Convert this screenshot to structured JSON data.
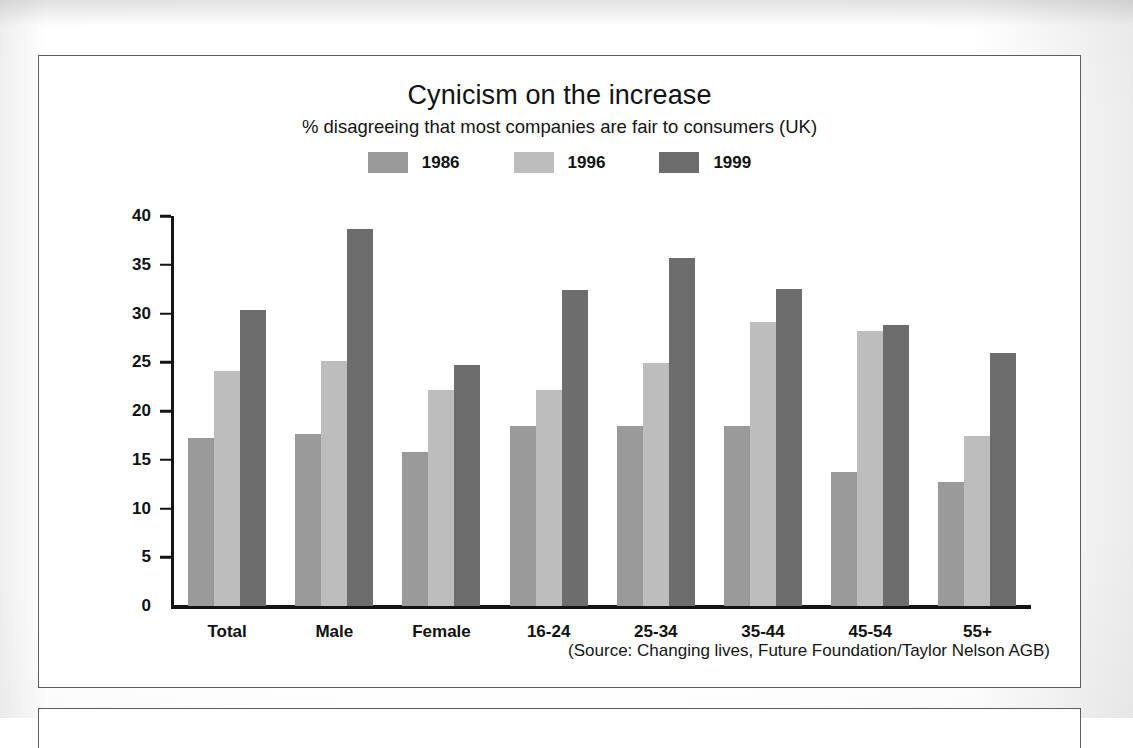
{
  "figure": {
    "title": "Cynicism on the increase",
    "subtitle": "% disagreeing that most companies are fair to consumers (UK)",
    "source": "(Source: Changing lives, Future Foundation/Taylor Nelson AGB)"
  },
  "colors": {
    "series_1986": "#9a9a9a",
    "series_1996": "#bdbdbd",
    "series_1999": "#6d6d6d",
    "axis": "#141414",
    "text": "#111111",
    "page": "#ffffff",
    "border": "#5d5d5d"
  },
  "legend": {
    "position": "top-center",
    "items": [
      {
        "label": "1986",
        "color": "#9a9a9a"
      },
      {
        "label": "1996",
        "color": "#bdbdbd"
      },
      {
        "label": "1999",
        "color": "#6d6d6d"
      }
    ]
  },
  "axis": {
    "y_ticks": [
      "40",
      "35",
      "30",
      "25",
      "20",
      "15",
      "10",
      "5",
      "0"
    ],
    "y_min": 0,
    "y_max": 40,
    "y_step": 5
  },
  "chart_data": {
    "type": "bar",
    "title": "Cynicism on the increase",
    "subtitle": "% disagreeing that most companies are fair to consumers (UK)",
    "xlabel": "",
    "ylabel": "",
    "ylim": [
      0,
      40
    ],
    "ytick_step": 5,
    "grid": false,
    "legend_position": "top-center",
    "note": "(Source: Changing lives, Future Foundation/Taylor Nelson AGB)",
    "categories": [
      "Total",
      "Male",
      "Female",
      "16-24",
      "25-34",
      "35-44",
      "45-54",
      "55+"
    ],
    "series": [
      {
        "name": "1986",
        "color": "#9a9a9a",
        "values": [
          17.2,
          17.6,
          15.8,
          18.5,
          18.5,
          18.5,
          13.7,
          12.7
        ]
      },
      {
        "name": "1996",
        "color": "#bdbdbd",
        "values": [
          24.1,
          25.1,
          22.2,
          22.2,
          24.9,
          29.1,
          28.2,
          17.4
        ]
      },
      {
        "name": "1999",
        "color": "#6d6d6d",
        "values": [
          30.4,
          38.7,
          24.7,
          32.4,
          35.7,
          32.5,
          28.8,
          25.9
        ]
      }
    ]
  }
}
